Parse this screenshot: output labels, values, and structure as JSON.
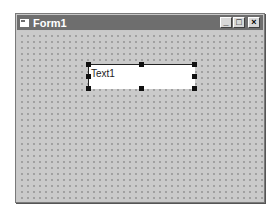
{
  "window": {
    "title": "Form1",
    "controls": {
      "minimize": "_",
      "maximize": "□",
      "close": "×"
    }
  },
  "form": {
    "grid": "dotted-design-grid",
    "textbox": {
      "text": "Text1",
      "selected": true
    }
  }
}
